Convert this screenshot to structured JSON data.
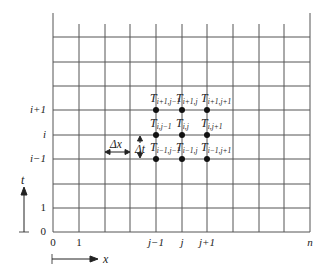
{
  "diagram": {
    "grid": {
      "x_lines": [
        53,
        79,
        105,
        130,
        156,
        182,
        207,
        233,
        259,
        284,
        310
      ],
      "y_lines": [
        37,
        62,
        86,
        110,
        135,
        159,
        184,
        208,
        232
      ],
      "line_color": "#555555"
    },
    "row_labels": [
      {
        "text": "i+1",
        "y": 110
      },
      {
        "text": "i",
        "y": 135
      },
      {
        "text": "i−1",
        "y": 159
      },
      {
        "text": "1",
        "y": 208
      },
      {
        "text": "0",
        "y": 232
      }
    ],
    "column_labels": [
      {
        "text": "0",
        "x": 53
      },
      {
        "text": "1",
        "x": 79
      },
      {
        "text": "j−1",
        "x": 156
      },
      {
        "text": "j",
        "x": 182
      },
      {
        "text": "j+1",
        "x": 207
      },
      {
        "text": "n",
        "x": 310
      }
    ],
    "nodes": [
      {
        "base": "T",
        "sub": "i+1,j−1",
        "x": 156,
        "y": 110
      },
      {
        "base": "T",
        "sub": "i+1,j",
        "x": 182,
        "y": 110
      },
      {
        "base": "T",
        "sub": "i+1,j+1",
        "x": 207,
        "y": 110
      },
      {
        "base": "T",
        "sub": "i,j−1",
        "x": 156,
        "y": 135
      },
      {
        "base": "T",
        "sub": "i,j",
        "x": 182,
        "y": 135
      },
      {
        "base": "T",
        "sub": "i,j+1",
        "x": 207,
        "y": 135
      },
      {
        "base": "T",
        "sub": "i−1,j−1",
        "x": 156,
        "y": 159
      },
      {
        "base": "T",
        "sub": "i−1,j",
        "x": 182,
        "y": 159
      },
      {
        "base": "T",
        "sub": "i−1,j+1",
        "x": 207,
        "y": 159
      }
    ],
    "dx_label": "Δx",
    "dt_label": "Δt",
    "t_axis_label": "t",
    "x_axis_label": "x"
  }
}
